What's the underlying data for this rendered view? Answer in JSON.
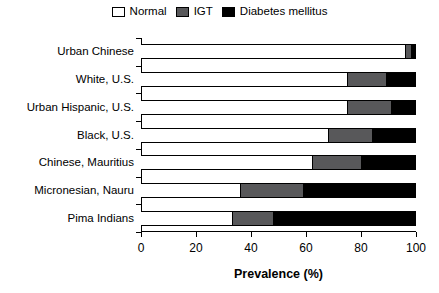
{
  "legend": {
    "position": "top-center",
    "entries": [
      {
        "label": "Normal",
        "swatch": "normal-swatch",
        "color": "#ffffff"
      },
      {
        "label": "IGT",
        "swatch": "igt-swatch",
        "color": "#58585a"
      },
      {
        "label": "Diabetes mellitus",
        "swatch": "diabetes-swatch",
        "color": "#000000"
      }
    ]
  },
  "axis": {
    "xlabel": "Prevalence (%)",
    "xticks": [
      0,
      20,
      40,
      60,
      80,
      100
    ],
    "xtick_labels": [
      "0",
      "20",
      "40",
      "60",
      "80",
      "100"
    ]
  },
  "chart_data": {
    "type": "bar",
    "orientation": "horizontal",
    "stacked": true,
    "title": "",
    "xlabel": "Prevalence (%)",
    "ylabel": "",
    "xlim": [
      0,
      100
    ],
    "grid": false,
    "legend_position": "top-center",
    "categories": [
      "Urban Chinese",
      "White, U.S.",
      "Urban Hispanic, U.S.",
      "Black, U.S.",
      "Chinese, Mauritius",
      "Micronesian, Nauru",
      "Pima Indians"
    ],
    "series": [
      {
        "name": "Normal",
        "color": "#ffffff",
        "values": [
          96,
          75,
          75,
          68,
          62,
          36,
          33
        ]
      },
      {
        "name": "IGT",
        "color": "#58585a",
        "values": [
          2,
          14,
          16,
          16,
          18,
          23,
          15
        ]
      },
      {
        "name": "Diabetes mellitus",
        "color": "#000000",
        "values": [
          2,
          11,
          9,
          16,
          20,
          41,
          52
        ]
      }
    ]
  }
}
